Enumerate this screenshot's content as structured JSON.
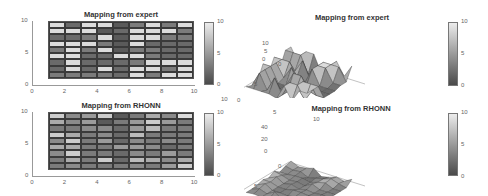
{
  "chart_data": [
    {
      "type": "heatmap",
      "title": "Mapping from expert",
      "xlim": [
        0,
        10
      ],
      "ylim": [
        0,
        10
      ],
      "xticks": [
        "0",
        "2",
        "4",
        "6",
        "8",
        "10"
      ],
      "yticks": [
        "0",
        "5",
        "10"
      ],
      "colorbar": {
        "ticks": [
          "0",
          "5",
          "10"
        ],
        "range": [
          0,
          10
        ],
        "colormap": "gray"
      },
      "columns_x": [
        1,
        2,
        3,
        4,
        5,
        6,
        7,
        8,
        9
      ],
      "rows_y_top_to_bottom": [
        9,
        8,
        7,
        6,
        5,
        4,
        3,
        2,
        1
      ],
      "values": [
        [
          9,
          2,
          9,
          9,
          1,
          3,
          9,
          3,
          9
        ],
        [
          9,
          9,
          9,
          1,
          2,
          9,
          9,
          9,
          3
        ],
        [
          2,
          2,
          3,
          9,
          1,
          9,
          9,
          3,
          3
        ],
        [
          9,
          9,
          9,
          3,
          1,
          9,
          2,
          2,
          2
        ],
        [
          3,
          9,
          3,
          9,
          1,
          3,
          3,
          2,
          2
        ],
        [
          9,
          9,
          2,
          2,
          9,
          9,
          3,
          2,
          2
        ],
        [
          2,
          9,
          2,
          2,
          2,
          3,
          9,
          9,
          9
        ],
        [
          2,
          9,
          2,
          9,
          2,
          9,
          9,
          3,
          9
        ],
        [
          3,
          3,
          3,
          3,
          2,
          9,
          3,
          9,
          9
        ]
      ]
    },
    {
      "type": "surface3d",
      "title": "Mapping from expert",
      "xlim": [
        0,
        10
      ],
      "ylim": [
        0,
        10
      ],
      "zlim": [
        0,
        10
      ],
      "xticks": [
        "0",
        "5",
        "10"
      ],
      "yticks": [
        "0",
        "5",
        "10"
      ],
      "zticks": [
        "0",
        "5",
        "10"
      ],
      "colorbar": {
        "ticks": [
          "0",
          "5",
          "10"
        ],
        "range": [
          0,
          10
        ],
        "colormap": "gray"
      },
      "note": "Surface of the same 9x9 expert mapping"
    },
    {
      "type": "heatmap",
      "title": "Mapping from RHONN",
      "xlim": [
        0,
        10
      ],
      "ylim": [
        0,
        10
      ],
      "xticks": [
        "0",
        "2",
        "4",
        "6",
        "8",
        "10"
      ],
      "yticks": [
        "0",
        "5",
        "10"
      ],
      "colorbar": {
        "ticks": [
          "0",
          "5",
          "10"
        ],
        "range": [
          0,
          10
        ],
        "colormap": "gray"
      },
      "columns_x": [
        1,
        2,
        3,
        4,
        5,
        6,
        7,
        8,
        9
      ],
      "rows_y_top_to_bottom": [
        9,
        8,
        7,
        6,
        5,
        4,
        3,
        2,
        1
      ],
      "values": [
        [
          8,
          4,
          5,
          8,
          1,
          3,
          6,
          4,
          9
        ],
        [
          6,
          4,
          5,
          1,
          3,
          5,
          8,
          5,
          3
        ],
        [
          3,
          3,
          4,
          4,
          2,
          5,
          7,
          3,
          3
        ],
        [
          8,
          6,
          3,
          4,
          2,
          7,
          3,
          3,
          3
        ],
        [
          4,
          8,
          3,
          5,
          2,
          4,
          3,
          4,
          3
        ],
        [
          6,
          6,
          3,
          3,
          5,
          5,
          4,
          2,
          3
        ],
        [
          4,
          8,
          3,
          3,
          2,
          4,
          3,
          5,
          3
        ],
        [
          3,
          6,
          3,
          8,
          2,
          7,
          6,
          4,
          6
        ],
        [
          3,
          4,
          3,
          3,
          3,
          4,
          3,
          5,
          8
        ]
      ]
    },
    {
      "type": "surface3d",
      "title": "Mapping from RHONN",
      "xlim": [
        0,
        10
      ],
      "ylim": [
        0,
        10
      ],
      "zlim": [
        0,
        40
      ],
      "xticks": [
        "0",
        "5",
        "10"
      ],
      "yticks": [
        "0",
        "5",
        "10"
      ],
      "zticks": [
        "0",
        "20",
        "40"
      ],
      "colorbar": {
        "ticks": [
          "0",
          "5",
          "10"
        ],
        "range": [
          0,
          10
        ],
        "colormap": "gray"
      },
      "note": "Surface of the same 9x9 RHONN mapping"
    }
  ],
  "labels": {
    "tl_title": "Mapping from expert",
    "tr_title": "Mapping from expert",
    "bl_title": "Mapping from RHONN",
    "br_title": "Mapping from RHONN"
  }
}
